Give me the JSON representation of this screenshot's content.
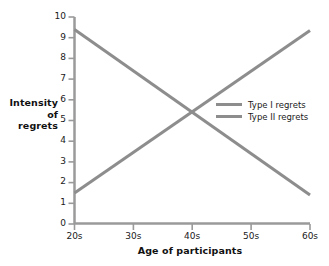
{
  "chart_data": {
    "type": "line",
    "title": "",
    "xlabel": "Age of participants",
    "ylabel": "Intensity\nof\nregrets",
    "categories": [
      "20s",
      "30s",
      "40s",
      "50s",
      "60s"
    ],
    "x": [
      20,
      30,
      40,
      50,
      60
    ],
    "xlim": [
      20,
      60
    ],
    "ylim": [
      0,
      10
    ],
    "ytick_labels": [
      "0",
      "1",
      "2",
      "3",
      "4",
      "5",
      "6",
      "7",
      "8",
      "9",
      "10"
    ],
    "yticks": [
      0,
      1,
      2,
      3,
      4,
      5,
      6,
      7,
      8,
      9,
      10
    ],
    "grid": false,
    "legend_position": "center-right",
    "series": [
      {
        "name": "Type I regrets",
        "color": "#8d8d8d",
        "values": [
          9.4,
          7.4,
          5.4,
          3.4,
          1.4
        ],
        "endpoints": {
          "start": 9.4,
          "end": 1.4
        }
      },
      {
        "name": "Type II regrets",
        "color": "#8d8d8d",
        "values": [
          1.5,
          3.5,
          5.45,
          7.4,
          9.35
        ],
        "endpoints": {
          "start": 1.5,
          "end": 9.35
        }
      }
    ],
    "axis_color": "#9a9a9a",
    "line_width": 3
  },
  "axes": {
    "y_title": "Intensity\nof\nregrets",
    "x_title": "Age of participants",
    "y_labels": {
      "t10": "10",
      "t9": "9",
      "t8": "8",
      "t7": "7",
      "t6": "6",
      "t5": "5",
      "t4": "4",
      "t3": "3",
      "t2": "2",
      "t1": "1",
      "t0": "0"
    },
    "x_labels": {
      "c0": "20s",
      "c1": "30s",
      "c2": "40s",
      "c3": "50s",
      "c4": "60s"
    }
  },
  "legend": {
    "entries": [
      {
        "label": "Type I regrets"
      },
      {
        "label": "Type II regrets"
      }
    ]
  }
}
